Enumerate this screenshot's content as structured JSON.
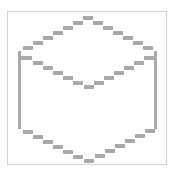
{
  "icon": {
    "name": "isometric-cube-outline",
    "style": "pixelated-dashed",
    "stroke_color": "#a9a9a9",
    "frame_color": "#d4d4d4",
    "background_color": "#ffffff"
  }
}
